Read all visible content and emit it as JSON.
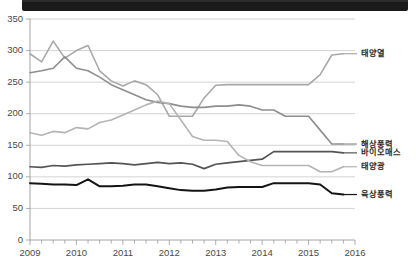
{
  "window": {
    "title_strip_visible": true
  },
  "chart_data": {
    "type": "line",
    "title": "",
    "xlabel": "",
    "ylabel": "",
    "ylim": [
      0,
      350
    ],
    "yticks": [
      "0",
      "50",
      "100",
      "150",
      "200",
      "250",
      "300",
      "350"
    ],
    "xticks": [
      "2009",
      "2010",
      "2011",
      "2012",
      "2013",
      "2014",
      "2015",
      "2016"
    ],
    "xlim": [
      2009,
      2016
    ],
    "grid": true,
    "legend_position": "right-inline",
    "minor_ticks_per_year": 4,
    "x": [
      2009.0,
      2009.25,
      2009.5,
      2009.75,
      2010.0,
      2010.25,
      2010.5,
      2010.75,
      2011.0,
      2011.25,
      2011.5,
      2011.75,
      2012.0,
      2012.25,
      2012.5,
      2012.75,
      2013.0,
      2013.25,
      2013.5,
      2013.75,
      2014.0,
      2014.25,
      2014.5,
      2014.75,
      2015.0,
      2015.25,
      2015.5,
      2015.75
    ],
    "series": [
      {
        "name": "태양열",
        "color": "#a8a8a8",
        "width": 1.6,
        "label_y": 295,
        "values": [
          295,
          282,
          315,
          288,
          300,
          308,
          268,
          252,
          244,
          252,
          246,
          230,
          196,
          196,
          196,
          225,
          245,
          246,
          246,
          246,
          246,
          246,
          246,
          246,
          246,
          262,
          293,
          295
        ]
      },
      {
        "name": "해상풍력",
        "color": "#8e8e8e",
        "width": 1.6,
        "label_y": 152,
        "values": [
          265,
          268,
          272,
          290,
          272,
          268,
          258,
          246,
          238,
          230,
          222,
          218,
          216,
          212,
          210,
          210,
          212,
          212,
          214,
          212,
          206,
          206,
          196,
          196,
          196,
          174,
          152,
          152
        ]
      },
      {
        "name": "바이오매스",
        "color": "#545454",
        "width": 1.7,
        "label_y": 138,
        "values": [
          116,
          115,
          118,
          117,
          119,
          120,
          121,
          122,
          121,
          119,
          121,
          123,
          121,
          122,
          120,
          113,
          120,
          122,
          124,
          126,
          128,
          140,
          140,
          140,
          140,
          140,
          140,
          138
        ]
      },
      {
        "name": "태양광",
        "color": "#b4b4b4",
        "width": 1.6,
        "label_y": 116,
        "values": [
          170,
          166,
          172,
          170,
          178,
          176,
          186,
          190,
          198,
          206,
          214,
          220,
          216,
          190,
          164,
          158,
          158,
          156,
          134,
          124,
          118,
          118,
          118,
          118,
          118,
          108,
          108,
          116
        ]
      },
      {
        "name": "육상풍력",
        "color": "#141414",
        "width": 2.0,
        "label_y": 72,
        "values": [
          90,
          89,
          88,
          88,
          87,
          96,
          85,
          85,
          86,
          88,
          88,
          85,
          82,
          79,
          78,
          78,
          80,
          83,
          84,
          84,
          84,
          90,
          90,
          90,
          90,
          88,
          74,
          72
        ]
      }
    ]
  }
}
